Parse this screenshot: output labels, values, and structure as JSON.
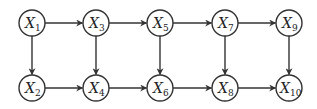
{
  "diagram": {
    "type": "directed-graph",
    "nodes": [
      {
        "id": "X1",
        "base": "X",
        "sub": "1",
        "x": 32,
        "y": 23
      },
      {
        "id": "X3",
        "base": "X",
        "sub": "3",
        "x": 96,
        "y": 23
      },
      {
        "id": "X5",
        "base": "X",
        "sub": "5",
        "x": 160,
        "y": 23
      },
      {
        "id": "X7",
        "base": "X",
        "sub": "7",
        "x": 225,
        "y": 23
      },
      {
        "id": "X9",
        "base": "X",
        "sub": "9",
        "x": 289,
        "y": 23
      },
      {
        "id": "X2",
        "base": "X",
        "sub": "2",
        "x": 32,
        "y": 88
      },
      {
        "id": "X4",
        "base": "X",
        "sub": "4",
        "x": 96,
        "y": 88
      },
      {
        "id": "X6",
        "base": "X",
        "sub": "6",
        "x": 160,
        "y": 88
      },
      {
        "id": "X8",
        "base": "X",
        "sub": "8",
        "x": 225,
        "y": 88
      },
      {
        "id": "X10",
        "base": "X",
        "sub": "10",
        "x": 289,
        "y": 88
      }
    ],
    "edges": [
      {
        "from": "X1",
        "to": "X3"
      },
      {
        "from": "X3",
        "to": "X5"
      },
      {
        "from": "X5",
        "to": "X7"
      },
      {
        "from": "X7",
        "to": "X9"
      },
      {
        "from": "X2",
        "to": "X4"
      },
      {
        "from": "X4",
        "to": "X6"
      },
      {
        "from": "X6",
        "to": "X8"
      },
      {
        "from": "X8",
        "to": "X10"
      },
      {
        "from": "X1",
        "to": "X2"
      },
      {
        "from": "X3",
        "to": "X4"
      },
      {
        "from": "X5",
        "to": "X6"
      },
      {
        "from": "X7",
        "to": "X8"
      },
      {
        "from": "X9",
        "to": "X10"
      }
    ],
    "node_radius": 13,
    "colors": {
      "stroke": "#333333",
      "fill": "#ffffff",
      "text": "#222222"
    }
  }
}
